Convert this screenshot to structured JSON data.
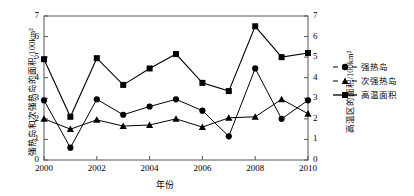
{
  "chart_data": {
    "type": "line",
    "title": "",
    "xlabel": "年份",
    "ylabel": "强热岛和次强热岛的面积/100km²",
    "ylabel_right": "高温区的面积/100km²",
    "x": [
      2000,
      2001,
      2002,
      2003,
      2004,
      2005,
      2006,
      2007,
      2008,
      2009,
      2010
    ],
    "xlim": [
      2000,
      2010
    ],
    "xticks": [
      "2000",
      "2002",
      "2004",
      "2006",
      "2008",
      "2010"
    ],
    "xtick_values": [
      2000,
      2002,
      2004,
      2006,
      2008,
      2010
    ],
    "ylim": [
      0,
      7
    ],
    "yticks": [
      "0",
      "1",
      "2",
      "3",
      "4",
      "5",
      "6",
      "7"
    ],
    "ylim_right": [
      0,
      7
    ],
    "yticks_right": [
      "0",
      "1",
      "2",
      "3",
      "4",
      "5",
      "6",
      "7"
    ],
    "grid": false,
    "legend_position": "right",
    "series": [
      {
        "name": "强热岛",
        "marker": "circle",
        "linestyle": "dashed-legend-solid-plot",
        "axis": "left",
        "color": "#000000",
        "values": [
          2.9,
          0.6,
          2.95,
          2.2,
          2.6,
          2.95,
          2.4,
          1.15,
          4.45,
          2.0,
          2.9
        ]
      },
      {
        "name": "次强热岛",
        "marker": "triangle",
        "linestyle": "dashed-legend-solid-plot",
        "axis": "left",
        "color": "#000000",
        "values": [
          2.0,
          1.5,
          1.95,
          1.65,
          1.7,
          2.0,
          1.6,
          2.05,
          2.1,
          2.95,
          2.25
        ]
      },
      {
        "name": "高温面积",
        "marker": "square",
        "linestyle": "solid",
        "axis": "right",
        "color": "#000000",
        "values": [
          4.9,
          2.1,
          4.95,
          3.65,
          4.45,
          5.15,
          3.75,
          3.35,
          6.5,
          5.0,
          5.2
        ]
      }
    ]
  },
  "legend": {
    "items": [
      {
        "label": "强热岛",
        "marker": "circle"
      },
      {
        "label": "次强热岛",
        "marker": "triangle"
      },
      {
        "label": "高温面积",
        "marker": "square"
      }
    ]
  }
}
